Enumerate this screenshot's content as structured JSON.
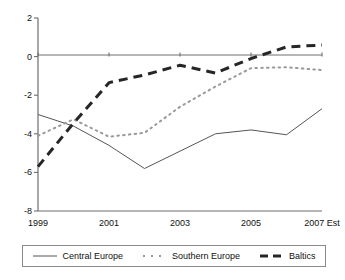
{
  "chart_data": {
    "type": "line",
    "title": "",
    "subtitle": "",
    "xlabel": "",
    "ylabel": "",
    "x": [
      1999,
      2000,
      2001,
      2002,
      2003,
      2004,
      2005,
      2006,
      2007
    ],
    "xtick_values": [
      1999,
      2001,
      2003,
      2005,
      2007
    ],
    "xtick_labels": [
      "1999",
      "2001",
      "2003",
      "2005",
      "2007 Est"
    ],
    "ytick_values": [
      2,
      0,
      -2,
      -4,
      -6,
      -8
    ],
    "ytick_labels": [
      "2",
      "0",
      "-2",
      "-4",
      "-6",
      "-8"
    ],
    "xlim": [
      1999,
      2007
    ],
    "ylim": [
      -8,
      2
    ],
    "grid": false,
    "zero_line": true,
    "legend_position": "bottom",
    "series": [
      {
        "name": "Central Europe",
        "style": "solid",
        "color": "#555555",
        "width": 1,
        "values": [
          -3.0,
          -3.6,
          -4.6,
          -5.8,
          -4.9,
          -4.0,
          -3.8,
          -4.05,
          -2.7
        ]
      },
      {
        "name": "Southern Europe",
        "style": "dotted",
        "color": "#9a9a9a",
        "width": 2,
        "values": [
          -4.1,
          -3.25,
          -4.15,
          -3.95,
          -2.6,
          -1.55,
          -0.6,
          -0.55,
          -0.7
        ]
      },
      {
        "name": "Baltics",
        "style": "dashed",
        "color": "#262626",
        "width": 3,
        "values": [
          -5.7,
          -3.45,
          -1.35,
          -0.95,
          -0.45,
          -0.85,
          -0.1,
          0.5,
          0.6
        ]
      }
    ]
  },
  "axes": {
    "ytick_labels": [
      "2",
      "0",
      "-2",
      "-4",
      "-6",
      "-8"
    ],
    "xtick_labels": [
      "1999",
      "2001",
      "2003",
      "2005",
      "2007 Est"
    ]
  },
  "legend": {
    "items": [
      {
        "label": "Central Europe",
        "style": "solid"
      },
      {
        "label": "Southern Europe",
        "style": "dotted"
      },
      {
        "label": "Baltics",
        "style": "dashed"
      }
    ]
  }
}
